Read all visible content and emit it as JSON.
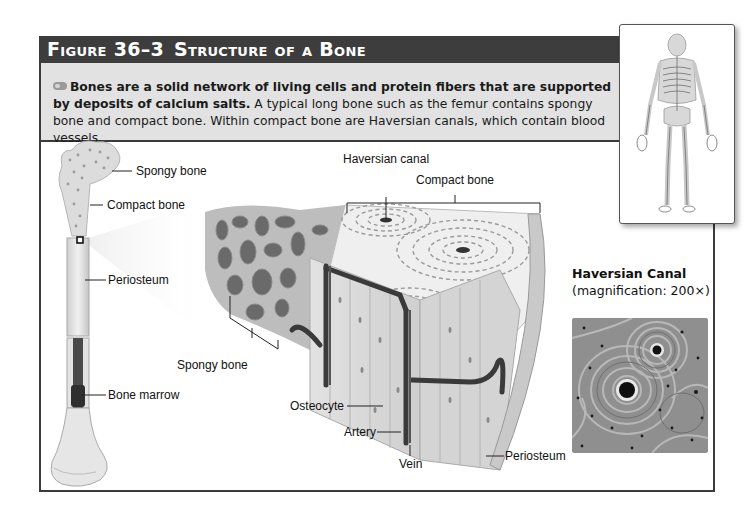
{
  "figure": {
    "number": "Figure 36–3",
    "title": "Structure of a Bone"
  },
  "intro": {
    "icon": "key-concept-icon",
    "bold_text": "Bones are a solid network of living cells and protein fibers that are supported by deposits of calcium salts.",
    "body_text": " A typical long bone such as the femur contains spongy bone and compact bone. Within compact bone are Haversian canals, which contain blood vessels."
  },
  "femur_labels": {
    "spongy_bone": "Spongy bone",
    "compact_bone": "Compact bone",
    "periosteum": "Periosteum",
    "bone_marrow": "Bone marrow"
  },
  "cross_section_labels": {
    "haversian_canal": "Haversian canal",
    "compact_bone": "Compact bone",
    "spongy_bone": "Spongy bone",
    "osteocyte": "Osteocyte",
    "artery": "Artery",
    "vein": "Vein",
    "periosteum": "Periosteum"
  },
  "micrograph": {
    "title": "Haversian Canal",
    "caption": "(magnification: 200×)"
  },
  "colors": {
    "header_bar": "#3d3d3d",
    "intro_panel": "#e2e2e2",
    "frame_border": "#3b3b3b"
  }
}
